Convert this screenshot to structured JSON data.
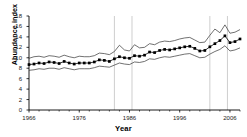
{
  "chart_data": {
    "type": "line",
    "title": "",
    "xlabel": "Year",
    "ylabel": "Abundance index",
    "xlim": [
      1966,
      2008
    ],
    "ylim": [
      0,
      18
    ],
    "ytick_values": [
      0,
      2,
      4,
      6,
      8,
      10,
      12,
      14,
      16,
      18
    ],
    "xtick_values": [
      1966,
      1976,
      1986,
      1996,
      2006
    ],
    "xtick_labels": [
      "1966",
      "1976",
      "1986",
      "1996",
      "2006"
    ],
    "ytick_labels": [
      "0",
      "2",
      "4",
      "6",
      "8",
      "10",
      "12",
      "14",
      "16",
      "18"
    ],
    "grid": "vertical reference lines only",
    "vertical_reference_lines": [
      1983,
      1986.5,
      2002,
      2005.5
    ],
    "legend": [],
    "marker": "filled-square",
    "line_color": "#000000",
    "band_color": "#333333",
    "x": [
      1966,
      1967,
      1968,
      1969,
      1970,
      1971,
      1972,
      1973,
      1974,
      1975,
      1976,
      1977,
      1978,
      1979,
      1980,
      1981,
      1982,
      1983,
      1984,
      1985,
      1986,
      1987,
      1988,
      1989,
      1990,
      1991,
      1992,
      1993,
      1994,
      1995,
      1996,
      1997,
      1998,
      1999,
      2000,
      2001,
      2002,
      2003,
      2004,
      2005,
      2006,
      2007,
      2008
    ],
    "series": [
      {
        "name": "Abundance index",
        "values": [
          8.7,
          8.8,
          9.0,
          8.9,
          9.2,
          9.1,
          8.9,
          9.3,
          9.0,
          8.8,
          9.0,
          9.0,
          9.0,
          9.2,
          9.6,
          9.5,
          9.3,
          9.8,
          10.2,
          10.0,
          9.9,
          10.4,
          10.3,
          10.5,
          11.1,
          11.0,
          11.4,
          11.6,
          11.5,
          11.7,
          11.9,
          12.1,
          12.2,
          11.8,
          11.3,
          11.4,
          12.1,
          12.7,
          13.3,
          14.2,
          12.9,
          13.1,
          13.6
        ]
      },
      {
        "name": "Upper confidence limit",
        "values": [
          9.9,
          10.2,
          10.3,
          10.1,
          10.4,
          10.3,
          10.1,
          10.5,
          10.2,
          10.0,
          10.3,
          10.2,
          10.2,
          10.4,
          10.9,
          10.8,
          10.6,
          11.2,
          12.4,
          11.5,
          11.3,
          12.5,
          11.9,
          12.0,
          12.7,
          12.5,
          13.0,
          13.2,
          13.1,
          13.3,
          13.6,
          13.8,
          13.9,
          13.4,
          12.9,
          13.0,
          14.3,
          15.5,
          14.8,
          16.3,
          14.7,
          14.9,
          15.4
        ]
      },
      {
        "name": "Lower confidence limit",
        "values": [
          7.6,
          7.7,
          7.9,
          7.8,
          8.0,
          8.0,
          7.8,
          8.1,
          7.9,
          7.7,
          7.9,
          7.9,
          7.9,
          8.1,
          8.4,
          8.3,
          8.2,
          8.6,
          9.0,
          8.8,
          8.7,
          9.2,
          9.1,
          9.3,
          9.8,
          9.7,
          10.0,
          10.2,
          10.1,
          10.3,
          10.5,
          10.7,
          10.8,
          10.4,
          10.0,
          10.1,
          10.7,
          11.2,
          11.6,
          12.3,
          11.3,
          11.5,
          11.9
        ]
      }
    ]
  }
}
